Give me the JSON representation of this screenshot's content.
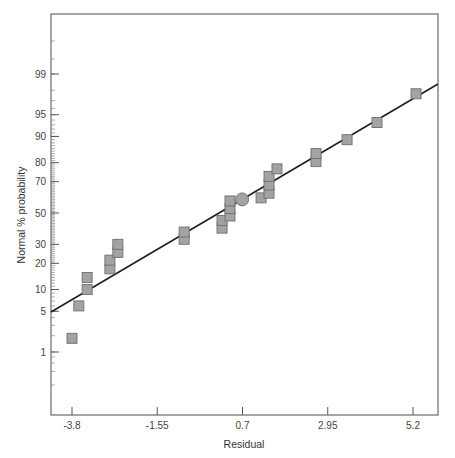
{
  "chart_data": {
    "type": "scatter",
    "title": "",
    "xlabel": "Residual",
    "ylabel": "Normal % probability",
    "x_ticks": [
      -3.8,
      -1.55,
      0.7,
      2.95,
      5.2
    ],
    "x_tick_labels": [
      "-3.8",
      "-1.55",
      "0.7",
      "2.95",
      "5.2"
    ],
    "y_ticks": [
      1,
      5,
      10,
      20,
      30,
      50,
      70,
      80,
      90,
      95,
      99
    ],
    "y_tick_labels": [
      "1",
      "5",
      "10",
      "20",
      "30",
      "50",
      "70",
      "80",
      "90",
      "95",
      "99"
    ],
    "y_scale": "normal-probability",
    "xlim": [
      -4.35,
      5.85
    ],
    "grid": false,
    "legend": null,
    "series": [
      {
        "name": "Residuals",
        "marker": "square",
        "points": [
          {
            "x": -3.8,
            "y": 1.8
          },
          {
            "x": -3.62,
            "y": 6.0
          },
          {
            "x": -3.4,
            "y": 10.0
          },
          {
            "x": -3.4,
            "y": 14.0
          },
          {
            "x": -2.8,
            "y": 17.5
          },
          {
            "x": -2.8,
            "y": 21.5
          },
          {
            "x": -2.59,
            "y": 25.5
          },
          {
            "x": -2.59,
            "y": 30.0
          },
          {
            "x": -0.84,
            "y": 33.0
          },
          {
            "x": -0.84,
            "y": 37.5
          },
          {
            "x": 0.16,
            "y": 40.0
          },
          {
            "x": 0.16,
            "y": 45.0
          },
          {
            "x": 0.37,
            "y": 48.0
          },
          {
            "x": 0.37,
            "y": 53.0
          },
          {
            "x": 0.37,
            "y": 58.0
          },
          {
            "x": 1.19,
            "y": 60.0
          },
          {
            "x": 1.4,
            "y": 63.0
          },
          {
            "x": 1.4,
            "y": 68.0
          },
          {
            "x": 1.4,
            "y": 73.0
          },
          {
            "x": 1.61,
            "y": 77.0
          },
          {
            "x": 2.64,
            "y": 80.5
          },
          {
            "x": 2.64,
            "y": 84.0
          },
          {
            "x": 3.46,
            "y": 89.0
          },
          {
            "x": 4.25,
            "y": 93.5
          },
          {
            "x": 5.28,
            "y": 97.7
          }
        ]
      },
      {
        "name": "Highlighted point",
        "marker": "circle",
        "points": [
          {
            "x": 0.69,
            "y": 59.0
          }
        ]
      }
    ],
    "reference_line": {
      "from": {
        "x": -4.35,
        "y": 5.0
      },
      "to": {
        "x": 5.85,
        "y": 98.5
      }
    },
    "colors": {
      "marker_fill": "#a3a3a3",
      "marker_stroke": "#6e6e6e",
      "line": "#1e1e1e",
      "axis": "#555555"
    }
  }
}
